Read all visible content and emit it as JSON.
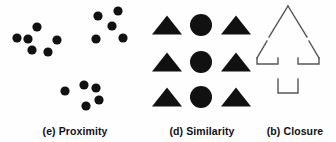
{
  "figure": {
    "background_color": "#fefefe",
    "ink_color": "#111111",
    "outline_color": "#555555"
  },
  "panels": [
    {
      "id": "proximity",
      "caption": "(e) Proximity",
      "shape_kind": "filled-circle",
      "description": "three separated clusters of black dots",
      "dot_radius": 4.6,
      "clusters": [
        {
          "name": "left-cluster",
          "count": 6,
          "dots": [
            {
              "cx": 37,
              "cy": 27
            },
            {
              "cx": 17,
              "cy": 38
            },
            {
              "cx": 28,
              "cy": 39
            },
            {
              "cx": 57,
              "cy": 40
            },
            {
              "cx": 32,
              "cy": 50
            },
            {
              "cx": 48,
              "cy": 52
            }
          ]
        },
        {
          "name": "top-right-cluster",
          "count": 5,
          "dots": [
            {
              "cx": 98,
              "cy": 16
            },
            {
              "cx": 118,
              "cy": 11
            },
            {
              "cx": 112,
              "cy": 26
            },
            {
              "cx": 96,
              "cy": 39
            },
            {
              "cx": 123,
              "cy": 38
            }
          ]
        },
        {
          "name": "bottom-cluster",
          "count": 5,
          "dots": [
            {
              "cx": 65,
              "cy": 91
            },
            {
              "cx": 84,
              "cy": 85
            },
            {
              "cx": 96,
              "cy": 88
            },
            {
              "cx": 99,
              "cy": 100
            },
            {
              "cx": 86,
              "cy": 106
            }
          ]
        }
      ]
    },
    {
      "id": "similarity",
      "caption": "(d) Similarity",
      "description": "3 by 3 grid; triangles in outer columns, circles in centre column",
      "rows": 3,
      "columns": 3,
      "column_centers": [
        17,
        51,
        86
      ],
      "row_centers": [
        25,
        62,
        97
      ],
      "triangle_half_width": 15,
      "triangle_height": 19,
      "circle_radius": 11,
      "grid": [
        [
          "triangle",
          "circle",
          "triangle"
        ],
        [
          "triangle",
          "circle",
          "triangle"
        ],
        [
          "triangle",
          "circle",
          "triangle"
        ]
      ]
    },
    {
      "id": "closure",
      "caption": "(b) Closure",
      "description": "outline of an upward arrow drawn with gaps so the contour is incomplete",
      "shape_kind": "arrow-outline-with-gaps",
      "stroke_width": 1.4,
      "segments": [
        {
          "name": "arrowhead-left-edge",
          "points": "34,6 15,37"
        },
        {
          "name": "arrowhead-right-edge",
          "points": "34,6 53,37"
        },
        {
          "name": "barb-left-edge",
          "points": "13,41 3,58"
        },
        {
          "name": "barb-right-edge",
          "points": "55,41 65,58"
        },
        {
          "name": "barb-left-underside",
          "points": "3,58 3,64 24,64 24,58"
        },
        {
          "name": "barb-right-underside",
          "points": "65,58 65,64 44,64 44,58"
        },
        {
          "name": "shaft-left-and-base",
          "points": "24,79 24,93 44,93 44,79"
        }
      ]
    }
  ]
}
